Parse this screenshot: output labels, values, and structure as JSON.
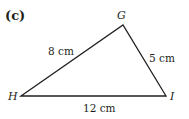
{
  "figure": {
    "part_label": "(c)",
    "type": "triangle",
    "vertices": [
      {
        "name": "G",
        "x": 123,
        "y": 25
      },
      {
        "name": "H",
        "x": 21,
        "y": 96
      },
      {
        "name": "I",
        "x": 166,
        "y": 96
      }
    ],
    "sides": [
      {
        "from": "H",
        "to": "G",
        "label": "8 cm"
      },
      {
        "from": "G",
        "to": "I",
        "label": "5 cm"
      },
      {
        "from": "H",
        "to": "I",
        "label": "12 cm"
      }
    ],
    "stroke_color": "#231f20"
  }
}
